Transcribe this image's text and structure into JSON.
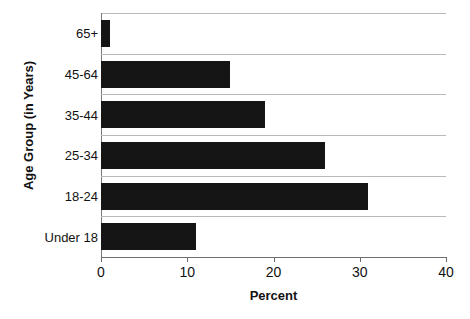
{
  "chart_data": {
    "type": "bar",
    "orientation": "horizontal",
    "title": "",
    "xlabel": "Percent",
    "ylabel": "Age Group (in Years)",
    "categories": [
      "Under 18",
      "18-24",
      "25-34",
      "35-44",
      "45-64",
      "65+"
    ],
    "values": [
      11,
      31,
      26,
      19,
      15,
      1
    ],
    "xlim": [
      0,
      40
    ],
    "xticks": [
      0,
      10,
      20,
      30,
      40
    ],
    "xtick_labels": [
      "0",
      "10",
      "20",
      "30",
      "40"
    ],
    "grid": "horizontal-category-separators",
    "legend": "none",
    "bar_color": "#151515",
    "gridline_color": "#b9b9b9",
    "axis_color": "#6e6e6e",
    "text_color": "#111111"
  },
  "footer": {
    "artifact_text": ""
  }
}
